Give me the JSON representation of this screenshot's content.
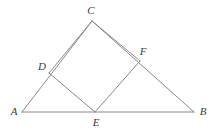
{
  "figure": {
    "width": 216,
    "height": 131,
    "background_color": "#ffffff",
    "stroke_color": "#8a8a8a",
    "stroke_width": 1,
    "label_color": "#3c3c3c"
  },
  "points": {
    "A": {
      "label": "A",
      "x": 22,
      "y": 112,
      "label_x": 14,
      "label_y": 111
    },
    "B": {
      "label": "B",
      "x": 194,
      "y": 112,
      "label_x": 203,
      "label_y": 111
    },
    "C": {
      "label": "C",
      "x": 92,
      "y": 21,
      "label_x": 91,
      "label_y": 10
    },
    "D": {
      "label": "D",
      "x": 49,
      "y": 73,
      "label_x": 42,
      "label_y": 66
    },
    "E": {
      "label": "E",
      "x": 95,
      "y": 112,
      "label_x": 96,
      "label_y": 122
    },
    "F": {
      "label": "F",
      "x": 140,
      "y": 61,
      "label_x": 143,
      "label_y": 51
    }
  },
  "segments": [
    {
      "name": "side-AB",
      "from": "A",
      "to": "B"
    },
    {
      "name": "side-AC",
      "from": "A",
      "to": "C"
    },
    {
      "name": "side-CB",
      "from": "C",
      "to": "B"
    },
    {
      "name": "square-edge-DC",
      "from": "D",
      "to": "C"
    },
    {
      "name": "square-edge-CF",
      "from": "C",
      "to": "F"
    },
    {
      "name": "square-edge-FE",
      "from": "F",
      "to": "E"
    },
    {
      "name": "square-edge-ED",
      "from": "E",
      "to": "D"
    }
  ]
}
